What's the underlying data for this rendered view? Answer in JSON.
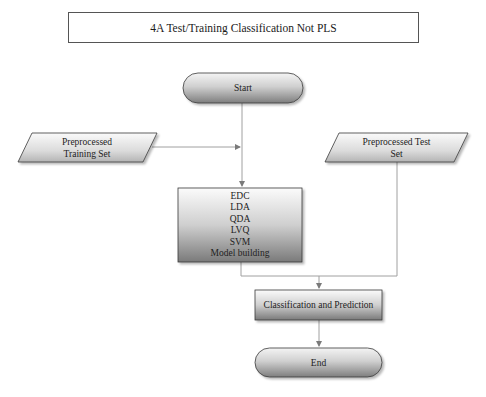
{
  "title": "4A Test/Training Classification Not PLS",
  "nodes": {
    "start": {
      "label": "Start",
      "shape": "terminator"
    },
    "training_set": {
      "label_line1": "Preprocessed",
      "label_line2": "Training Set",
      "shape": "data-parallelogram"
    },
    "test_set": {
      "label_line1": "Preprocessed Test",
      "label_line2": "Set",
      "shape": "data-parallelogram"
    },
    "models": {
      "shape": "process",
      "items": [
        "EDC",
        "LDA",
        "QDA",
        "LVQ",
        "SVM",
        "Model building"
      ]
    },
    "classification": {
      "label": "Classification and Prediction",
      "shape": "process"
    },
    "end": {
      "label": "End",
      "shape": "terminator"
    }
  },
  "edges": [
    {
      "from": "start",
      "to": "models"
    },
    {
      "from": "training_set",
      "to": "models"
    },
    {
      "from": "models",
      "to": "classification"
    },
    {
      "from": "test_set",
      "to": "classification"
    },
    {
      "from": "classification",
      "to": "end"
    }
  ],
  "colors": {
    "shape_fill_light": "#f2f2f2",
    "shape_fill_dark": "#8c8c8c",
    "stroke": "#3a3a3a",
    "connector": "#9a9a9a"
  }
}
